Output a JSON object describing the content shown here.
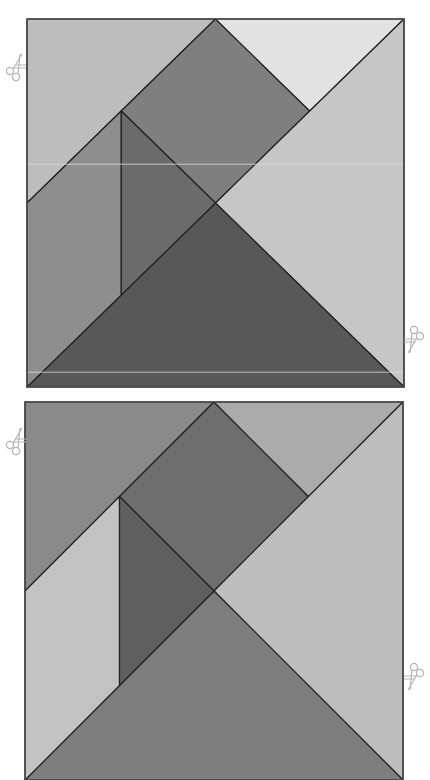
{
  "puzzles": [
    {
      "name": "tangram-square-1",
      "x": 27,
      "y": 19,
      "width": 377,
      "height": 368,
      "border": "#4a4a4a",
      "pieces": [
        {
          "name": "large-triangle-top-left",
          "points": [
            [
              0,
              0
            ],
            [
              0.5,
              0
            ],
            [
              0,
              0.5
            ]
          ],
          "fill": "#bdbdbd"
        },
        {
          "name": "square-piece",
          "points": [
            [
              0.5,
              0
            ],
            [
              0.75,
              0.25
            ],
            [
              0.5,
              0.5
            ],
            [
              0.25,
              0.25
            ]
          ],
          "fill": "#7f7f7f"
        },
        {
          "name": "small-triangle-top-right",
          "points": [
            [
              0.5,
              0
            ],
            [
              1,
              0
            ],
            [
              0.75,
              0.25
            ]
          ],
          "fill": "#e2e2e2"
        },
        {
          "name": "large-triangle-right",
          "points": [
            [
              1,
              0
            ],
            [
              1,
              1
            ],
            [
              0.5,
              0.5
            ]
          ],
          "fill": "#c6c6c6"
        },
        {
          "name": "large-triangle-bottom",
          "points": [
            [
              0,
              1
            ],
            [
              1,
              1
            ],
            [
              0.5,
              0.5
            ]
          ],
          "fill": "#585858"
        },
        {
          "name": "parallelogram-left",
          "points": [
            [
              0,
              0.5
            ],
            [
              0.25,
              0.25
            ],
            [
              0.25,
              0.75
            ],
            [
              0,
              1
            ]
          ],
          "fill": "#8e8e8e"
        },
        {
          "name": "small-triangle-middle",
          "points": [
            [
              0.25,
              0.25
            ],
            [
              0.5,
              0.5
            ],
            [
              0.25,
              0.75
            ]
          ],
          "fill": "#6b6b6b"
        }
      ]
    },
    {
      "name": "tangram-square-2",
      "x": 25,
      "y": 402,
      "width": 378,
      "height": 378,
      "border": "#4a4a4a",
      "pieces": [
        {
          "name": "large-triangle-top-left",
          "points": [
            [
              0,
              0
            ],
            [
              0.5,
              0
            ],
            [
              0,
              0.5
            ]
          ],
          "fill": "#8a8a8a"
        },
        {
          "name": "square-piece",
          "points": [
            [
              0.5,
              0
            ],
            [
              0.75,
              0.25
            ],
            [
              0.5,
              0.5
            ],
            [
              0.25,
              0.25
            ]
          ],
          "fill": "#6e6e6e"
        },
        {
          "name": "small-triangle-top-right",
          "points": [
            [
              0.5,
              0
            ],
            [
              1,
              0
            ],
            [
              0.75,
              0.25
            ]
          ],
          "fill": "#ababab"
        },
        {
          "name": "large-triangle-right",
          "points": [
            [
              1,
              0
            ],
            [
              1,
              1
            ],
            [
              0.5,
              0.5
            ]
          ],
          "fill": "#bebebe"
        },
        {
          "name": "large-triangle-bottom",
          "points": [
            [
              0,
              1
            ],
            [
              1,
              1
            ],
            [
              0.5,
              0.5
            ]
          ],
          "fill": "#7e7e7e"
        },
        {
          "name": "parallelogram-left",
          "points": [
            [
              0,
              0.5
            ],
            [
              0.25,
              0.25
            ],
            [
              0.25,
              0.75
            ],
            [
              0,
              1
            ]
          ],
          "fill": "#c2c2c2"
        },
        {
          "name": "small-triangle-middle",
          "points": [
            [
              0.25,
              0.25
            ],
            [
              0.5,
              0.5
            ],
            [
              0.25,
              0.75
            ]
          ],
          "fill": "#5f5f5f"
        }
      ]
    }
  ],
  "scissors": [
    {
      "name": "scissors-icon-top-left-1",
      "x": 4,
      "y": 52,
      "rotate": 0
    },
    {
      "name": "scissors-icon-bottom-right-1",
      "x": 404,
      "y": 325,
      "rotate": 180
    },
    {
      "name": "scissors-icon-top-left-2",
      "x": 4,
      "y": 426,
      "rotate": 0
    },
    {
      "name": "scissors-icon-bottom-right-2",
      "x": 404,
      "y": 662,
      "rotate": 180
    }
  ],
  "scissors_color": "#b5b5b5",
  "stripe_color": "#d8d8d8"
}
